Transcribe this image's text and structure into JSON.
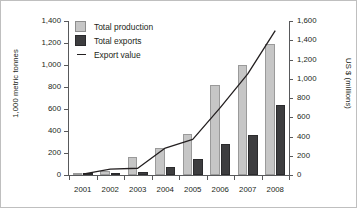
{
  "chart_data": {
    "type": "bar",
    "title": "",
    "subtitle": "",
    "xlabel": "",
    "ylabel": "1,000 metric tonnes",
    "y2label": "US $ (millions)",
    "categories": [
      "2001",
      "2002",
      "2003",
      "2004",
      "2005",
      "2006",
      "2007",
      "2008"
    ],
    "ylim": [
      0,
      1400
    ],
    "y2lim": [
      0,
      1600
    ],
    "yticks": [
      "0",
      "200",
      "400",
      "600",
      "800",
      "1,000",
      "1,200",
      "1,400"
    ],
    "y2ticks": [
      "0",
      "200",
      "400",
      "600",
      "800",
      "1,000",
      "1,200",
      "1,400",
      "1,600"
    ],
    "grid": false,
    "legend_position": "top-left",
    "series": [
      {
        "name": "Total production",
        "type": "bar",
        "axis": "left",
        "color": "#c6c6c6",
        "values": [
          20,
          40,
          165,
          245,
          370,
          820,
          1000,
          1195
        ]
      },
      {
        "name": "Total exports",
        "type": "bar",
        "axis": "left",
        "color": "#3d3d3f",
        "values": [
          5,
          20,
          25,
          75,
          150,
          280,
          360,
          640
        ]
      },
      {
        "name": "Export value",
        "type": "line",
        "axis": "right",
        "color": "#231f20",
        "values": [
          10,
          60,
          70,
          280,
          370,
          700,
          1050,
          1500
        ]
      }
    ]
  },
  "legend": {
    "items": [
      {
        "label": "Total production",
        "marker": "square-light-swatch"
      },
      {
        "label": "Total exports",
        "marker": "square-dark-swatch"
      },
      {
        "label": "Export value",
        "marker": "line-swatch"
      }
    ]
  }
}
